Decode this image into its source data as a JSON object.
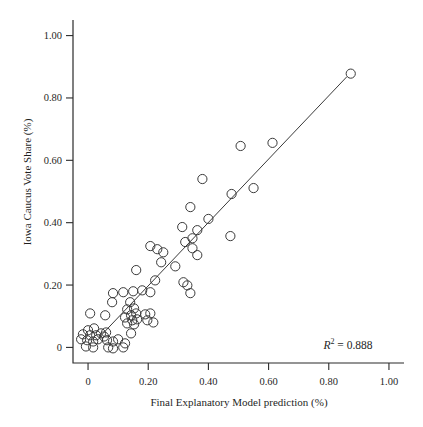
{
  "figure": {
    "background_color": "#ffffff",
    "axis_color": "#2b2b2b",
    "text_color": "#1f1f1f"
  },
  "chart_data": {
    "type": "scatter",
    "title": "",
    "xlabel": "Final Explanatory Model prediction (%)",
    "ylabel": "Iowa Caucus Vote Share (%)",
    "xlim": [
      -0.05,
      1.05
    ],
    "ylim": [
      -0.05,
      1.05
    ],
    "x_ticks": [
      0,
      0.2,
      0.4,
      0.6,
      0.8,
      1.0
    ],
    "x_tick_labels": [
      "0",
      "0.20",
      "0.40",
      "0.60",
      "0.80",
      "1.00"
    ],
    "y_ticks": [
      0,
      0.2,
      0.4,
      0.6,
      0.8,
      1.0
    ],
    "y_tick_labels": [
      "0",
      "0.20",
      "0.40",
      "0.60",
      "0.80",
      "1.00"
    ],
    "grid": false,
    "legend": null,
    "marker": {
      "style": "open-circle",
      "radius_px": 4.6,
      "color": "#3a3a3a"
    },
    "regression_line": {
      "x1": 0.04,
      "y1": 0.035,
      "x2": 0.86,
      "y2": 0.868,
      "color": "#3a3a3a"
    },
    "annotation": {
      "variable": "R",
      "exponent": "2",
      "value_text": " = 0.888",
      "r_squared": 0.888,
      "position": {
        "x": 0.865,
        "y": 0.005
      }
    },
    "points": [
      [
        0.873,
        0.878
      ],
      [
        0.507,
        0.646
      ],
      [
        0.613,
        0.656
      ],
      [
        0.38,
        0.54
      ],
      [
        0.55,
        0.511
      ],
      [
        0.477,
        0.492
      ],
      [
        0.34,
        0.45
      ],
      [
        0.4,
        0.412
      ],
      [
        0.313,
        0.386
      ],
      [
        0.363,
        0.376
      ],
      [
        0.473,
        0.357
      ],
      [
        0.347,
        0.35
      ],
      [
        0.207,
        0.325
      ],
      [
        0.23,
        0.315
      ],
      [
        0.25,
        0.305
      ],
      [
        0.323,
        0.338
      ],
      [
        0.347,
        0.318
      ],
      [
        0.363,
        0.296
      ],
      [
        0.243,
        0.273
      ],
      [
        0.29,
        0.26
      ],
      [
        0.16,
        0.248
      ],
      [
        0.223,
        0.215
      ],
      [
        0.317,
        0.209
      ],
      [
        0.33,
        0.199
      ],
      [
        0.18,
        0.183
      ],
      [
        0.207,
        0.177
      ],
      [
        0.34,
        0.174
      ],
      [
        0.083,
        0.174
      ],
      [
        0.117,
        0.177
      ],
      [
        0.15,
        0.18
      ],
      [
        0.08,
        0.145
      ],
      [
        0.007,
        0.109
      ],
      [
        0.057,
        0.103
      ],
      [
        0.14,
        0.145
      ],
      [
        0.153,
        0.125
      ],
      [
        0.13,
        0.122
      ],
      [
        0.16,
        0.109
      ],
      [
        0.143,
        0.103
      ],
      [
        0.123,
        0.096
      ],
      [
        0.163,
        0.09
      ],
      [
        0.147,
        0.087
      ],
      [
        0.13,
        0.077
      ],
      [
        0.153,
        0.074
      ],
      [
        0.19,
        0.106
      ],
      [
        0.207,
        0.109
      ],
      [
        0.197,
        0.087
      ],
      [
        0.217,
        0.08
      ],
      [
        0.0,
        0.055
      ],
      [
        0.02,
        0.061
      ],
      [
        -0.017,
        0.042
      ],
      [
        0.007,
        0.039
      ],
      [
        0.027,
        0.039
      ],
      [
        0.043,
        0.045
      ],
      [
        0.06,
        0.048
      ],
      [
        0.053,
        0.035
      ],
      [
        -0.023,
        0.026
      ],
      [
        -0.003,
        0.023
      ],
      [
        0.017,
        0.019
      ],
      [
        0.033,
        0.026
      ],
      [
        0.063,
        0.023
      ],
      [
        0.083,
        0.019
      ],
      [
        0.1,
        0.026
      ],
      [
        0.123,
        0.013
      ],
      [
        -0.007,
        0.003
      ],
      [
        0.017,
        0.0
      ],
      [
        0.067,
        0.0
      ],
      [
        0.083,
        -0.003
      ],
      [
        0.117,
        0.0
      ],
      [
        0.143,
        0.045
      ]
    ]
  }
}
